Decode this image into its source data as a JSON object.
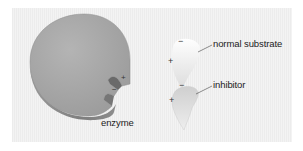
{
  "labels": {
    "enzyme": "enzyme",
    "normal_substrate": "normal substrate",
    "inhibitor": "inhibitor"
  },
  "charges": {
    "substrate_top": "−",
    "substrate_left": "+",
    "inhibitor_top": "−",
    "inhibitor_left": "+",
    "enzyme_site_upper": "+",
    "enzyme_site_lower": "−"
  },
  "colors": {
    "enzyme_top": "#a8a8a8",
    "enzyme_side": "#8a8a8a",
    "background": "#f0f0f0"
  }
}
